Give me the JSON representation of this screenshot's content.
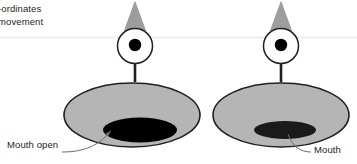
{
  "figure": {
    "background_color": "#ffffff",
    "width": 357,
    "height": 164,
    "caption": {
      "line1": "-ordinates",
      "line2": "movement"
    },
    "rule": {
      "name": "horizontal-separator",
      "color": "#e9e9e9",
      "y": 37
    },
    "palette": {
      "body_fill": "#b5b5b5",
      "cone_fill": "#9d9d9d",
      "head_fill": "#ffffff",
      "pupil_fill": "#000000",
      "mouth_fill": "#000000",
      "outline": "#231f20",
      "leader_line": "#6d6d6d",
      "text": "#231f20"
    },
    "subjects": [
      {
        "id": "left-figure",
        "name": "figure-mouth-open",
        "label": "Mouth open",
        "state": "open",
        "cone": {
          "apex_x": 135,
          "apex_y": 1,
          "base_left_x": 119,
          "base_right_x": 151,
          "base_y": 46
        },
        "head": {
          "cx": 135,
          "cy": 46,
          "r": 17.5
        },
        "pupil": {
          "cx": 135,
          "cy": 45,
          "r": 6.2
        },
        "stem": {
          "x": 135,
          "y1": 63,
          "y2": 80,
          "width": 2.6
        },
        "body": {
          "cx": 132,
          "cy": 115,
          "rx": 68,
          "ry": 32
        },
        "mouth": {
          "cx": 140,
          "cy": 130,
          "rx": 37,
          "ry": 12.5
        },
        "leader": {
          "from_x": 68,
          "from_y": 150,
          "to_x": 110,
          "to_y": 132
        }
      },
      {
        "id": "right-figure",
        "name": "figure-mouth-closed",
        "label": "Mouth",
        "state": "closed",
        "cone": {
          "apex_x": 281,
          "apex_y": 1,
          "base_left_x": 265,
          "base_right_x": 297,
          "base_y": 46
        },
        "head": {
          "cx": 281,
          "cy": 46,
          "r": 17.5
        },
        "pupil": {
          "cx": 281,
          "cy": 45,
          "r": 6.2
        },
        "stem": {
          "x": 281,
          "y1": 63,
          "y2": 80,
          "width": 2.6
        },
        "body": {
          "cx": 281,
          "cy": 115,
          "rx": 68,
          "ry": 32
        },
        "mouth": {
          "cx": 285,
          "cy": 130,
          "rx": 31,
          "ry": 9
        },
        "leader": {
          "from_x": 305,
          "from_y": 152,
          "to_x": 288,
          "to_y": 136
        }
      }
    ]
  }
}
